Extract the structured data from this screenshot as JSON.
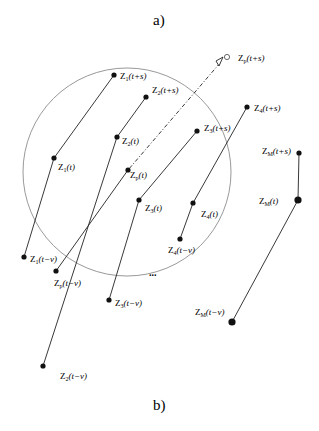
{
  "captions": {
    "top": "a)",
    "bottom": "b)"
  },
  "circle": {
    "cx": 127,
    "cy": 172,
    "r": 104,
    "color": "#999999"
  },
  "ellipsis": "...",
  "trajectories": [
    {
      "id": "1",
      "points": [
        {
          "x": 114,
          "y": 75,
          "label": "Z",
          "sub": "1",
          "arg": "(t+s)",
          "lx": 120,
          "ly": 79
        },
        {
          "x": 54,
          "y": 158,
          "label": "Z",
          "sub": "1",
          "arg": "(t)",
          "lx": 58,
          "ly": 170
        },
        {
          "x": 24,
          "y": 257,
          "label": "Z",
          "sub": "1",
          "arg": "(t−v)",
          "lx": 30,
          "ly": 262
        }
      ]
    },
    {
      "id": "2",
      "points": [
        {
          "x": 146,
          "y": 97,
          "label": "Z",
          "sub": "2",
          "arg": "(t+s)",
          "lx": 152,
          "ly": 93
        },
        {
          "x": 117,
          "y": 137,
          "label": "Z",
          "sub": "2",
          "arg": "(t)",
          "lx": 122,
          "ly": 144
        },
        {
          "x": 43,
          "y": 366,
          "label": "Z",
          "sub": "2",
          "arg": "(t−v)",
          "lx": 60,
          "ly": 379
        }
      ]
    },
    {
      "id": "3",
      "points": [
        {
          "x": 197,
          "y": 131,
          "label": "Z",
          "sub": "3",
          "arg": "(t+s)",
          "lx": 204,
          "ly": 131
        },
        {
          "x": 139,
          "y": 200,
          "label": "Z",
          "sub": "3",
          "arg": "(t)",
          "lx": 145,
          "ly": 211
        },
        {
          "x": 109,
          "y": 300,
          "label": "Z",
          "sub": "3",
          "arg": "(t−v)",
          "lx": 115,
          "ly": 306
        }
      ]
    },
    {
      "id": "4",
      "points": [
        {
          "x": 247,
          "y": 107,
          "label": "Z",
          "sub": "4",
          "arg": "(t+s)",
          "lx": 254,
          "ly": 111
        },
        {
          "x": 193,
          "y": 203,
          "label": "Z",
          "sub": "4",
          "arg": "(t)",
          "lx": 201,
          "ly": 217
        },
        {
          "x": 180,
          "y": 239,
          "label": "Z",
          "sub": "4",
          "arg": "(t−v)",
          "lx": 168,
          "ly": 253
        }
      ]
    },
    {
      "id": "p",
      "dashed_future": true,
      "points": [
        {
          "x": 227,
          "y": 57,
          "open": true,
          "label": "Z",
          "sub": "p",
          "arg": "(t+s)",
          "lx": 238,
          "ly": 61
        },
        {
          "x": 128,
          "y": 170,
          "label": "Z",
          "sub": "p",
          "arg": "(t)",
          "lx": 130,
          "ly": 178
        },
        {
          "x": 56,
          "y": 271,
          "label": "Z",
          "sub": "p",
          "arg": "(t−v)",
          "lx": 54,
          "ly": 286
        }
      ]
    },
    {
      "id": "M",
      "points": [
        {
          "x": 299,
          "y": 153,
          "label": "Z",
          "sub": "M",
          "arg": "(t+s)",
          "lx": 262,
          "ly": 154
        },
        {
          "x": 298,
          "y": 200,
          "big": true,
          "label": "Z",
          "sub": "M",
          "arg": "(t)",
          "lx": 259,
          "ly": 204
        },
        {
          "x": 232,
          "y": 322,
          "big": true,
          "label": "Z",
          "sub": "M",
          "arg": "(t−v)",
          "lx": 195,
          "ly": 315
        }
      ]
    }
  ]
}
